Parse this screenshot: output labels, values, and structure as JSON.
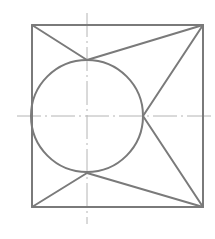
{
  "diagram": {
    "type": "geometric-construction",
    "colors": {
      "background": "#ffffff",
      "outline": "#7a7a7a",
      "centerline": "#b4b4b4"
    },
    "square": {
      "x1": 32,
      "y1": 25,
      "x2": 203,
      "y2": 207
    },
    "circle": {
      "cx": 87,
      "cy": 116,
      "r": 56
    },
    "centerlines": {
      "horizontal": {
        "x1": 17,
        "y1": 116,
        "x2": 213,
        "y2": 116
      },
      "vertical": {
        "x1": 87,
        "y1": 13,
        "x2": 87,
        "y2": 224
      }
    },
    "segments": [
      {
        "name": "top-left-corner-to-circle-top",
        "x1": 32,
        "y1": 25,
        "x2": 87,
        "y2": 60
      },
      {
        "name": "circle-top-to-top-right-corner",
        "x1": 87,
        "y1": 60,
        "x2": 203,
        "y2": 25
      },
      {
        "name": "top-right-corner-to-circle-right",
        "x1": 203,
        "y1": 25,
        "x2": 143,
        "y2": 116
      },
      {
        "name": "circle-right-to-bottom-right-corner",
        "x1": 143,
        "y1": 116,
        "x2": 203,
        "y2": 207
      },
      {
        "name": "bottom-right-corner-to-circle-bottom",
        "x1": 203,
        "y1": 207,
        "x2": 87,
        "y2": 173
      },
      {
        "name": "circle-bottom-to-bottom-left-corner",
        "x1": 87,
        "y1": 173,
        "x2": 32,
        "y2": 207
      }
    ]
  }
}
